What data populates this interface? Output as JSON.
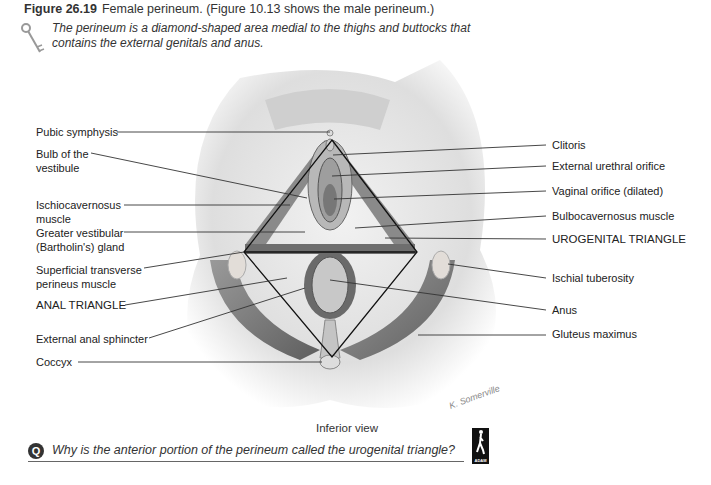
{
  "figure": {
    "number": "Figure 26.19",
    "title": "Female perineum. (Figure 10.13 shows the male perineum.)",
    "summary": "The perineum is a diamond-shaped area medial to the thighs and buttocks that contains the external genitals and anus.",
    "key_icon": "key-icon"
  },
  "labels_left": [
    {
      "text": "Pubic symphysis"
    },
    {
      "text": "Bulb of the",
      "text2": "vestibule"
    },
    {
      "text": "Ischiocavernosus",
      "text2": "muscle"
    },
    {
      "text": "Greater vestibular",
      "text2": "(Bartholin's) gland"
    },
    {
      "text": "Superficial transverse",
      "text2": "perineus muscle"
    },
    {
      "text": "ANAL TRIANGLE"
    },
    {
      "text": "External anal sphincter"
    },
    {
      "text": "Coccyx"
    }
  ],
  "labels_right": [
    {
      "text": "Clitoris"
    },
    {
      "text": "External urethral orifice"
    },
    {
      "text": "Vaginal orifice (dilated)"
    },
    {
      "text": "Bulbocavernosus muscle"
    },
    {
      "text": "UROGENITAL TRIANGLE"
    },
    {
      "text": "Ischial tuberosity"
    },
    {
      "text": "Anus"
    },
    {
      "text": "Gluteus maximus"
    }
  ],
  "caption": "Inferior view",
  "signature": "K. Somerville",
  "question": {
    "icon_text": "Q",
    "text": "Why is the anterior portion of the perineum called the urogenital triangle?"
  },
  "logo": {
    "text": "ADAM"
  },
  "colors": {
    "diamond_line": "#111111",
    "leader_line": "#333333",
    "muscle": "#7a7a7a",
    "skin": "#dcdcdc"
  }
}
